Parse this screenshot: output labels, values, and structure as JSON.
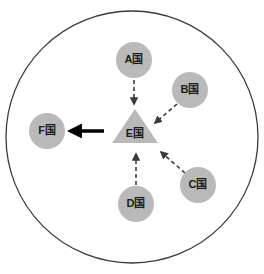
{
  "diagram": {
    "boundary": {
      "name": "outer-circle",
      "cx": 132,
      "cy": 137,
      "r": 126,
      "stroke": "#3a3a3a",
      "stroke_width": 1.3,
      "fill": "#ffffff"
    },
    "colors": {
      "node_fill": "#b9b9b9",
      "node_fill_triangle": "#b9b9b9",
      "label_text": "#1c1c1c",
      "dashed_arrow": "#3a3a3a",
      "solid_arrow": "#000000",
      "background": "#ffffff"
    },
    "nodes": [
      {
        "id": "A",
        "name": "node-a",
        "label": "A国",
        "shape": "circle",
        "cx": 134,
        "cy": 60,
        "r": 18
      },
      {
        "id": "B",
        "name": "node-b",
        "label": "B国",
        "shape": "circle",
        "cx": 190,
        "cy": 90,
        "r": 18
      },
      {
        "id": "C",
        "name": "node-c",
        "label": "C国",
        "shape": "circle",
        "cx": 198,
        "cy": 185,
        "r": 18
      },
      {
        "id": "D",
        "name": "node-d",
        "label": "D国",
        "shape": "circle",
        "cx": 136,
        "cy": 204,
        "r": 18
      },
      {
        "id": "E",
        "name": "node-e",
        "label": "E国",
        "shape": "triangle",
        "cx": 135,
        "cy": 133,
        "half_width": 23,
        "apex_y": 109,
        "base_y": 143
      },
      {
        "id": "F",
        "name": "node-f",
        "label": "F国",
        "shape": "circle",
        "cx": 47,
        "cy": 131,
        "r": 18
      }
    ],
    "edges": [
      {
        "name": "edge-a-to-e",
        "from": "A",
        "to": "E",
        "style": "dashed",
        "x1": 134,
        "y1": 80,
        "x2": 134,
        "y2": 104
      },
      {
        "name": "edge-b-to-e",
        "from": "B",
        "to": "E",
        "style": "dashed",
        "x1": 177,
        "y1": 104,
        "x2": 155,
        "y2": 123
      },
      {
        "name": "edge-c-to-e",
        "from": "C",
        "to": "E",
        "style": "dashed",
        "x1": 185,
        "y1": 173,
        "x2": 161,
        "y2": 152
      },
      {
        "name": "edge-d-to-e",
        "from": "D",
        "to": "E",
        "style": "dashed",
        "x1": 136,
        "y1": 185,
        "x2": 136,
        "y2": 154
      },
      {
        "name": "edge-e-to-f",
        "from": "E",
        "to": "F",
        "style": "solid",
        "x1": 104,
        "y1": 131,
        "x2": 70,
        "y2": 131
      }
    ]
  }
}
